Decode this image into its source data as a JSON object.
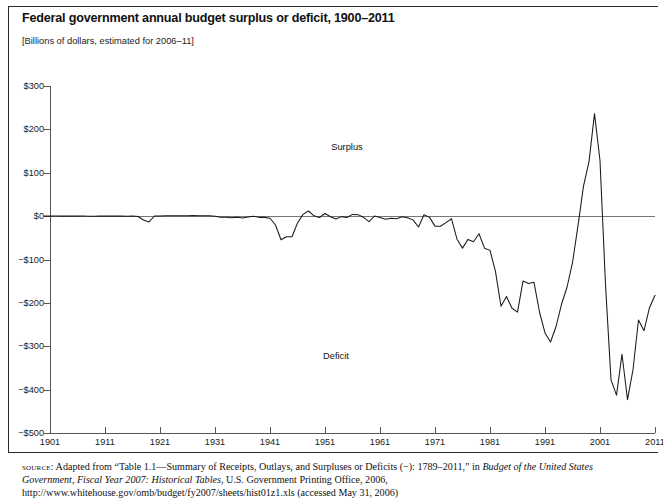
{
  "figure": {
    "title": "Federal government annual budget surplus or deficit, 1900–2011",
    "subtitle": "[Billions of dollars, estimated for 2006–11]",
    "annotations": {
      "surplus_label": "Surplus",
      "deficit_label": "Deficit"
    },
    "source": {
      "lead": "source:",
      "body_1": " Adapted from “Table 1.1—Summary of Receipts, Outlays, and Surpluses or Deficits (−): 1789–2011,” in ",
      "italic_1": "Budget of the United States Government, Fiscal Year 2007: Historical Tables",
      "body_2": ", U.S. Government Printing Office, 2006, http://www.whitehouse.gov/omb/budget/fy2007/sheets/hist01z1.xls (accessed May 31, 2006)"
    },
    "colors": {
      "line": "#1a1a1a",
      "axis": "#555555",
      "zero_line": "#777777",
      "frame": "#2b2b2b",
      "background": "#ffffff"
    }
  },
  "chart_data": {
    "type": "line",
    "title": "Federal government annual budget surplus or deficit, 1900–2011",
    "subtitle": "[Billions of dollars, estimated for 2006–11]",
    "xlabel": "",
    "ylabel": "Billions of dollars",
    "xlim": [
      1900,
      2011
    ],
    "ylim": [
      -500,
      300
    ],
    "ytick_labels": [
      "$300",
      "$200",
      "$100",
      "$0",
      "−$100",
      "−$200",
      "−$300",
      "−$400",
      "−$500"
    ],
    "ytick_values": [
      300,
      200,
      100,
      0,
      -100,
      -200,
      -300,
      -400,
      -500
    ],
    "xtick_labels": [
      "1901",
      "1911",
      "1921",
      "1931",
      "1941",
      "1951",
      "1961",
      "1971",
      "1981",
      "1991",
      "2001",
      "2011"
    ],
    "xtick_values": [
      1901,
      1911,
      1921,
      1931,
      1941,
      1951,
      1961,
      1971,
      1981,
      1991,
      2001,
      2011
    ],
    "grid": false,
    "legend": "none",
    "annotations": [
      {
        "text": "Surplus",
        "x": 1955,
        "y": 160
      },
      {
        "text": "Deficit",
        "x": 1953,
        "y": -322
      }
    ],
    "series": [
      {
        "name": "Surplus or deficit",
        "x": [
          1900,
          1901,
          1902,
          1903,
          1904,
          1905,
          1906,
          1907,
          1908,
          1909,
          1910,
          1911,
          1912,
          1913,
          1914,
          1915,
          1916,
          1917,
          1918,
          1919,
          1920,
          1921,
          1922,
          1923,
          1924,
          1925,
          1926,
          1927,
          1928,
          1929,
          1930,
          1931,
          1932,
          1933,
          1934,
          1935,
          1936,
          1937,
          1938,
          1939,
          1940,
          1941,
          1942,
          1943,
          1944,
          1945,
          1946,
          1947,
          1948,
          1949,
          1950,
          1951,
          1952,
          1953,
          1954,
          1955,
          1956,
          1957,
          1958,
          1959,
          1960,
          1961,
          1962,
          1963,
          1964,
          1965,
          1966,
          1967,
          1968,
          1969,
          1970,
          1971,
          1972,
          1973,
          1974,
          1975,
          1976,
          1977,
          1978,
          1979,
          1980,
          1981,
          1982,
          1983,
          1984,
          1985,
          1986,
          1987,
          1988,
          1989,
          1990,
          1991,
          1992,
          1993,
          1994,
          1995,
          1996,
          1997,
          1998,
          1999,
          2000,
          2001,
          2002,
          2003,
          2004,
          2005,
          2006,
          2007,
          2008,
          2009,
          2010,
          2011
        ],
        "values": [
          0.05,
          0.06,
          0.08,
          0.0,
          -0.04,
          -0.02,
          0.03,
          0.09,
          -0.06,
          -0.09,
          -0.02,
          0.01,
          0.0,
          -0.0,
          0.0,
          -0.06,
          0.05,
          -0.85,
          -9.03,
          -13.36,
          0.29,
          0.51,
          0.74,
          0.71,
          1.0,
          0.72,
          0.87,
          1.16,
          0.94,
          0.73,
          0.74,
          -0.46,
          -2.74,
          -2.6,
          -3.63,
          -2.8,
          -4.3,
          -2.22,
          -0.09,
          -2.85,
          -2.92,
          -4.94,
          -20.5,
          -54.55,
          -47.55,
          -47.55,
          -15.94,
          4.02,
          11.8,
          0.58,
          -3.12,
          6.1,
          -1.52,
          -6.49,
          -1.15,
          -3.04,
          3.95,
          3.41,
          -2.77,
          -12.85,
          0.3,
          -3.34,
          -7.15,
          -4.76,
          -5.92,
          -1.41,
          -3.7,
          -8.64,
          -25.16,
          3.24,
          -2.84,
          -23.03,
          -23.37,
          -14.91,
          -6.14,
          -53.24,
          -73.73,
          -53.66,
          -59.19,
          -40.73,
          -73.83,
          -78.97,
          -127.98,
          -207.8,
          -185.37,
          -212.31,
          -221.23,
          -149.73,
          -155.18,
          -152.64,
          -221.04,
          -269.24,
          -290.32,
          -255.05,
          -203.19,
          -164.01,
          -107.43,
          -21.88,
          69.27,
          125.61,
          236.24,
          128.24,
          -157.76,
          -377.59,
          -412.73,
          -318.35,
          -423.21,
          -354.16,
          -239.36,
          -264.02,
          -211.07,
          -182.27
        ]
      }
    ]
  }
}
